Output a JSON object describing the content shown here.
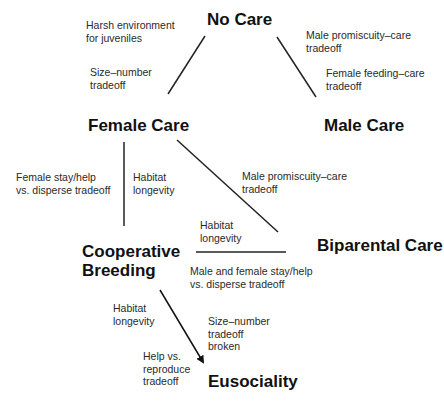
{
  "nodes": {
    "no_care": "No Care",
    "female_care": "Female Care",
    "male_care": "Male Care",
    "cooperative_breeding_1": "Cooperative",
    "cooperative_breeding_2": "Breeding",
    "biparental_care": "Biparental Care",
    "eusociality": "Eusociality"
  },
  "labels": {
    "harsh_env": [
      "Harsh environment",
      "for juveniles"
    ],
    "size_number": [
      "Size–number",
      "tradeoff"
    ],
    "male_promisc_top": [
      "Male promiscuity–care",
      "tradeoff"
    ],
    "female_feeding": [
      "Female feeding–care",
      "tradeoff"
    ],
    "female_stay": [
      "Female stay/help",
      "vs. disperse tradeoff"
    ],
    "habitat_1": [
      "Habitat",
      "longevity"
    ],
    "male_promisc_mid": [
      "Male promiscuity–care",
      "tradeoff"
    ],
    "habitat_2": [
      "Habitat",
      "longevity"
    ],
    "male_female_stay": [
      "Male and female stay/help",
      "vs. disperse tradeoff"
    ],
    "habitat_3": [
      "Habitat",
      "longevity"
    ],
    "size_number_broken": [
      "Size–number",
      "tradeoff",
      "broken"
    ],
    "help_reproduce": [
      "Help vs.",
      "reproduce",
      "tradeoff"
    ]
  },
  "edges": [
    {
      "from": "No Care",
      "to": "Female Care"
    },
    {
      "from": "No Care",
      "to": "Male Care"
    },
    {
      "from": "Female Care",
      "to": "Cooperative Breeding"
    },
    {
      "from": "Female Care",
      "to": "Biparental Care"
    },
    {
      "from": "Cooperative Breeding",
      "to": "Biparental Care"
    },
    {
      "from": "Cooperative Breeding",
      "to": "Eusociality",
      "arrow": true
    }
  ]
}
